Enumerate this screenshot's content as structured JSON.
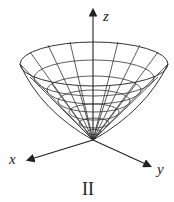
{
  "figure": {
    "surface": "cone",
    "axes": {
      "x_label": "x",
      "y_label": "y",
      "z_label": "z"
    },
    "caption": "II",
    "stroke_color": "#222222"
  }
}
